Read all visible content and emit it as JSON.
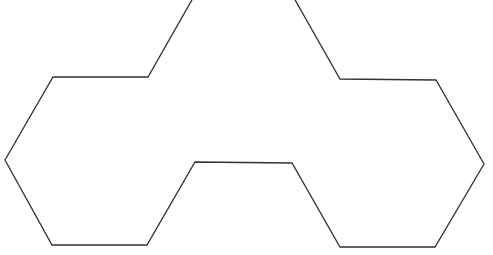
{
  "diagram": {
    "stroke_color": "#333333",
    "background_color": "#ffffff",
    "stroke_width": 1.3,
    "outline_points": [
      [
        193,
        -2
      ],
      [
        148,
        77
      ],
      [
        53,
        77
      ],
      [
        5,
        160
      ],
      [
        52,
        245
      ],
      [
        147,
        245
      ],
      [
        195,
        162
      ],
      [
        292,
        163
      ],
      [
        340,
        247
      ],
      [
        435,
        247
      ],
      [
        484,
        164
      ],
      [
        436,
        80
      ],
      [
        340,
        79
      ],
      [
        294,
        -2
      ]
    ]
  }
}
